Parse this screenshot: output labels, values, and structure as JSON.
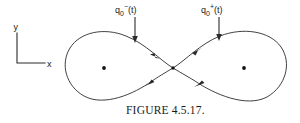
{
  "figure": {
    "caption": "FIGURE 4.5.17.",
    "axes": {
      "y_label": "y",
      "x_label": "x",
      "origin_px": [
        17,
        63
      ],
      "y_tip_px": [
        17,
        33
      ],
      "x_tip_px": [
        45,
        63
      ]
    },
    "labels": [
      {
        "id": "q-minus",
        "base": "q",
        "subscript": "0",
        "superscript": "−",
        "argument": "(t)",
        "full_text": "q₀⁻(t)",
        "meaning": "left-branch homoclinic trajectory",
        "text_px": [
          115,
          11
        ],
        "pointer_from_px": [
          135,
          17
        ],
        "pointer_to_px": [
          135,
          42
        ]
      },
      {
        "id": "q-plus",
        "base": "q",
        "subscript": "0",
        "superscript": "+",
        "argument": "(t)",
        "full_text": "q₀⁺(t)",
        "meaning": "right-branch homoclinic trajectory",
        "text_px": [
          201,
          11
        ],
        "pointer_from_px": [
          219,
          17
        ],
        "pointer_to_px": [
          219,
          40
        ]
      }
    ],
    "curve": {
      "type": "lemniscate",
      "description": "figure-eight homoclinic orbit",
      "crossing_point_px": [
        173,
        68
      ],
      "left_extent_px": 66,
      "right_extent_px": 290,
      "top_extent_px": 30,
      "bottom_extent_px": 106
    },
    "center_dots": [
      {
        "id": "left-focus",
        "px": [
          104,
          68
        ]
      },
      {
        "id": "right-focus",
        "px": [
          244,
          68
        ]
      },
      {
        "id": "saddle-point",
        "px": [
          173,
          68
        ]
      }
    ],
    "flow_arrows": [
      {
        "id": "upper-left-branch",
        "direction": "toward-saddle",
        "px": [
          155,
          55
        ]
      },
      {
        "id": "upper-right-branch",
        "direction": "away-from-saddle",
        "px": [
          196,
          52
        ]
      },
      {
        "id": "lower-left-branch",
        "direction": "away-from-saddle",
        "px": [
          150,
          83
        ]
      },
      {
        "id": "lower-right-branch",
        "direction": "toward-saddle",
        "px": [
          199,
          84
        ]
      }
    ],
    "colors": {
      "ink": "#2b2b2b",
      "background": "#ffffff"
    }
  }
}
